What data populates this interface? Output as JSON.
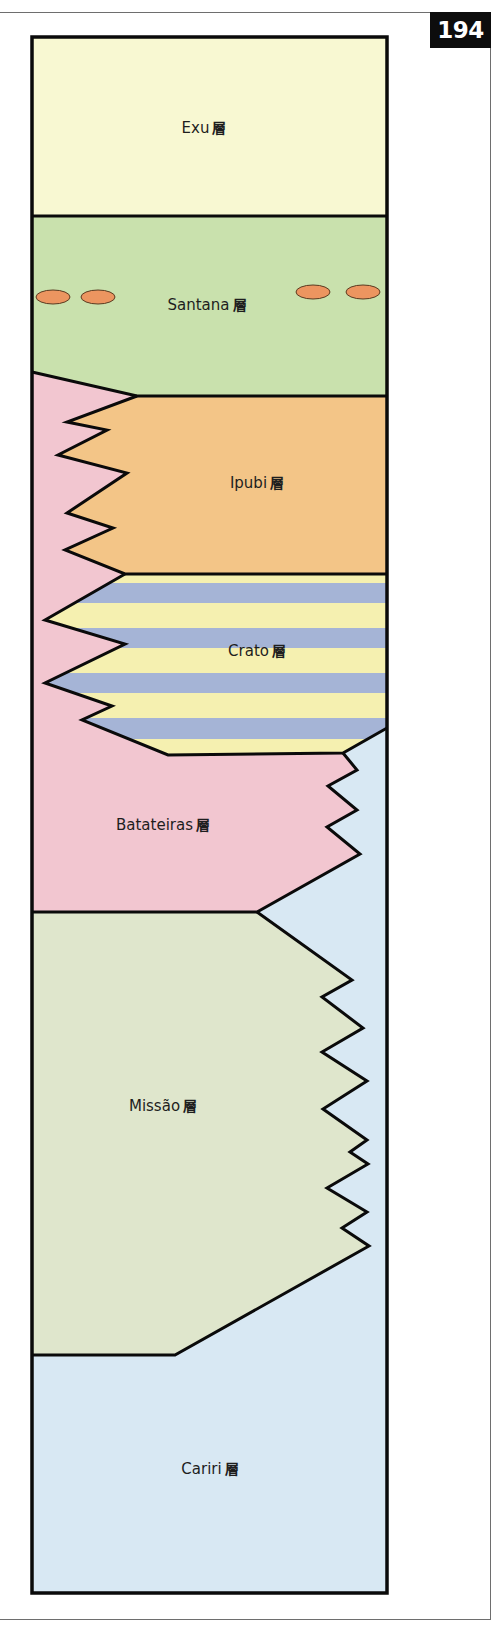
{
  "page": {
    "number": "194"
  },
  "colors": {
    "exu": "#f8f8d2",
    "santana": "#c9e1ad",
    "ipubi": "#f3c587",
    "crato_yellow": "#f5f0b0",
    "crato_blue": "#a5b4d6",
    "batateiras": "#f2c6d0",
    "missao": "#dfe6cc",
    "cariri": "#d8e8f3",
    "nodule": "#ec9560",
    "outline": "#0a0a0a"
  },
  "layers": [
    {
      "name": "Exu",
      "suffix": "層",
      "label": "Exu"
    },
    {
      "name": "Santana",
      "suffix": "層",
      "label": "Santana"
    },
    {
      "name": "Ipubi",
      "suffix": "層",
      "label": "Ipubi"
    },
    {
      "name": "Crato",
      "suffix": "層",
      "label": "Crato"
    },
    {
      "name": "Batateiras",
      "suffix": "層",
      "label": "Batateiras"
    },
    {
      "name": "Missão",
      "suffix": "層",
      "label": "Missão"
    },
    {
      "name": "Cariri",
      "suffix": "層",
      "label": "Cariri"
    }
  ],
  "santana_nodules": [
    {
      "cx": 53,
      "cy": 297
    },
    {
      "cx": 98,
      "cy": 297
    },
    {
      "cx": 313,
      "cy": 292
    },
    {
      "cx": 363,
      "cy": 292
    }
  ]
}
